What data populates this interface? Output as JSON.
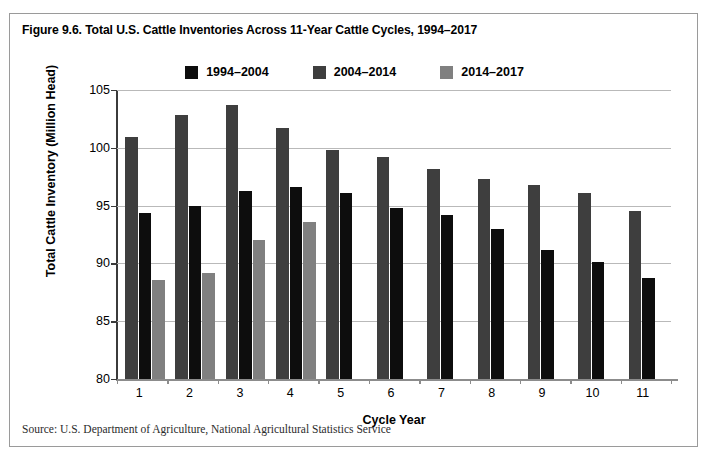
{
  "figure": {
    "title": "Figure 9.6. Total U.S. Cattle Inventories Across 11-Year Cattle Cycles, 1994–2017",
    "source": "Source: U.S. Department of Agriculture, National Agricultural Statistics Service"
  },
  "colors": {
    "series_1": "#3e3e3e",
    "series_2": "#0d0d0d",
    "series_3": "#808080",
    "gridline": "#b9b9b9",
    "axis": "#3b3b3b",
    "border": "#9a9a9a",
    "background": "#ffffff",
    "text": "#000000"
  },
  "chart_data": {
    "type": "bar",
    "title": "Figure 9.6. Total U.S. Cattle Inventories Across 11-Year Cattle Cycles, 1994–2017",
    "xlabel": "Cycle Year",
    "ylabel": "Total Cattle Inventory (Million Head)",
    "categories": [
      "1",
      "2",
      "3",
      "4",
      "5",
      "6",
      "7",
      "8",
      "9",
      "10",
      "11"
    ],
    "ylim": [
      80,
      105
    ],
    "yticks": [
      80,
      85,
      90,
      95,
      100,
      105
    ],
    "ytick_labels": [
      "80",
      "85",
      "90",
      "95",
      "100",
      "105"
    ],
    "grid": true,
    "legend_position": "top-center",
    "series": [
      {
        "name": "1994–2004",
        "color": "#3e3e3e",
        "values": [
          100.9,
          102.8,
          103.7,
          101.7,
          99.8,
          99.2,
          98.2,
          97.3,
          96.8,
          96.1,
          94.5
        ]
      },
      {
        "name": "2004–2014",
        "color": "#0d0d0d",
        "values": [
          94.4,
          95.0,
          96.3,
          96.6,
          96.1,
          94.8,
          94.2,
          93.0,
          91.2,
          90.1,
          88.7
        ]
      },
      {
        "name": "2014–2017",
        "color": "#808080",
        "values": [
          88.6,
          89.2,
          92.0,
          93.6,
          null,
          null,
          null,
          null,
          null,
          null,
          null
        ]
      }
    ]
  }
}
